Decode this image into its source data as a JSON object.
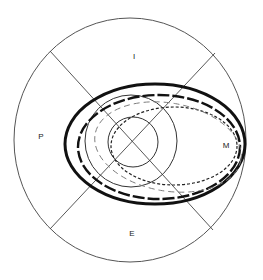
{
  "diagram": {
    "type": "visual-field-style polar diagram",
    "colors": {
      "stroke": "#222222",
      "light_stroke": "#777777",
      "background": "#ffffff"
    },
    "quadrant_labels": {
      "top": "I",
      "left": "P",
      "right": "M",
      "bottom": "E"
    },
    "shapes": [
      {
        "name": "outer-boundary",
        "style": "thin solid"
      },
      {
        "name": "cross-lines",
        "style": "thin solid diagonals"
      },
      {
        "name": "small-central-circle",
        "style": "thin solid"
      },
      {
        "name": "medium-circle",
        "style": "thin solid"
      },
      {
        "name": "outer-ellipse",
        "style": "thick solid"
      },
      {
        "name": "long-dash-ellipse",
        "style": "thick long dash"
      },
      {
        "name": "short-dash-ellipse",
        "style": "short dash"
      },
      {
        "name": "light-dash-ellipse",
        "style": "thin light dash"
      }
    ]
  }
}
